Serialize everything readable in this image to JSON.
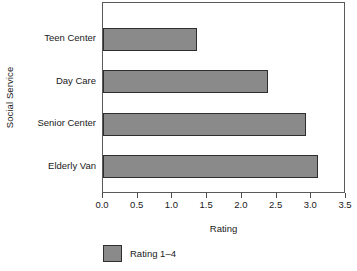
{
  "chart_data": {
    "type": "bar",
    "orientation": "horizontal",
    "title": "",
    "xlabel": "Rating",
    "ylabel": "Social Service",
    "categories": [
      "Teen Center",
      "Day Care",
      "Senior Center",
      "Elderly Van"
    ],
    "values": [
      1.35,
      2.37,
      2.92,
      3.09
    ],
    "series": [
      {
        "name": "Rating 1–4",
        "values": [
          1.35,
          2.37,
          2.92,
          3.09
        ]
      }
    ],
    "xlim": [
      0.0,
      3.5
    ],
    "xticks": [
      "0.0",
      "0.5",
      "1.0",
      "1.5",
      "2.0",
      "2.5",
      "3.0",
      "3.5"
    ],
    "xtick_values": [
      0.0,
      0.5,
      1.0,
      1.5,
      2.0,
      2.5,
      3.0,
      3.5
    ],
    "grid": false,
    "legend": {
      "position": "bottom-left",
      "entries": [
        "Rating 1–4"
      ]
    },
    "colors": {
      "bar_fill": "#8a8a8a",
      "bar_border": "#2e2e2e",
      "axis": "#5a5a5a",
      "text": "#1a1a1a",
      "background": "#ffffff"
    }
  }
}
